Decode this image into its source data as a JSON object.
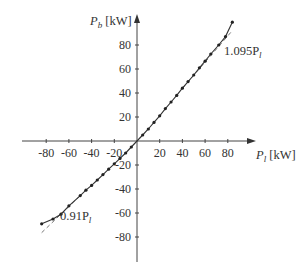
{
  "chart_data": {
    "type": "line",
    "title": "",
    "xlabel": "P_l [kW]",
    "ylabel": "P_b [kW]",
    "xlabel_main": "P",
    "xlabel_sub": "l",
    "xlabel_unit": " [kW]",
    "ylabel_main": "P",
    "ylabel_sub": "b",
    "ylabel_unit": " [kW]",
    "xlim": [
      -100,
      100
    ],
    "ylim": [
      -100,
      100
    ],
    "x_ticks": [
      -80,
      -60,
      -40,
      -20,
      20,
      40,
      60,
      80
    ],
    "y_ticks": [
      80,
      60,
      40,
      20,
      -20,
      -40,
      -60,
      -80
    ],
    "grid": false,
    "legend": null,
    "series": [
      {
        "name": "measured P_b vs P_l",
        "style": "solid line with dot markers",
        "x": [
          -84,
          -74,
          -67,
          -60,
          -50,
          -45,
          -40,
          -35,
          -30,
          -25,
          -20,
          -15,
          -10,
          -5,
          0,
          5,
          10,
          15,
          20,
          25,
          30,
          35,
          40,
          45,
          50,
          55,
          60,
          65,
          72,
          78,
          84
        ],
        "y": [
          -69,
          -65,
          -61,
          -54,
          -45.5,
          -41,
          -37,
          -32.5,
          -28,
          -23.5,
          -19,
          -14.5,
          -10,
          -5,
          0,
          5,
          10,
          15.5,
          21,
          27,
          32.5,
          38,
          44,
          49.5,
          55,
          61,
          66.5,
          72.5,
          80,
          87,
          99
        ]
      },
      {
        "name": "1.095P_l",
        "style": "dashed",
        "slope": 1.095,
        "x": [
          40,
          84
        ],
        "y": [
          43.8,
          92.0
        ]
      },
      {
        "name": "0.91P_l",
        "style": "dashed",
        "slope": 0.91,
        "x": [
          -84,
          -50
        ],
        "y": [
          -76.4,
          -45.5
        ]
      }
    ],
    "annotations": [
      {
        "text_main": "1.095P",
        "text_sub": "l",
        "near": [
          76,
          80
        ]
      },
      {
        "text_main": "0.91P",
        "text_sub": "l",
        "near": [
          -68,
          -62
        ]
      }
    ]
  }
}
